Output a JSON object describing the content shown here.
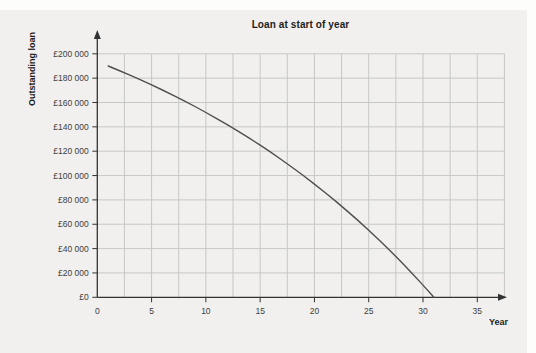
{
  "chart_data": {
    "type": "line",
    "title": "Loan at start of year",
    "xlabel": "Year",
    "ylabel": "Outstanding loan",
    "xlim": [
      0,
      37.5
    ],
    "ylim": [
      0,
      200000
    ],
    "grid": true,
    "x_gridline_step": 2.5,
    "y_gridline_step": 20000,
    "x_ticks": [
      {
        "value": 0,
        "label": "0"
      },
      {
        "value": 5,
        "label": "5"
      },
      {
        "value": 10,
        "label": "10"
      },
      {
        "value": 15,
        "label": "15"
      },
      {
        "value": 20,
        "label": "20"
      },
      {
        "value": 25,
        "label": "25"
      },
      {
        "value": 30,
        "label": "30"
      },
      {
        "value": 35,
        "label": "35"
      }
    ],
    "y_ticks": [
      {
        "value": 0,
        "label": "£0"
      },
      {
        "value": 20000,
        "label": "£20 000"
      },
      {
        "value": 40000,
        "label": "£40 000"
      },
      {
        "value": 60000,
        "label": "£60 000"
      },
      {
        "value": 80000,
        "label": "£80 000"
      },
      {
        "value": 100000,
        "label": "£100 000"
      },
      {
        "value": 120000,
        "label": "£120 000"
      },
      {
        "value": 140000,
        "label": "£140 000"
      },
      {
        "value": 160000,
        "label": "£160 000"
      },
      {
        "value": 180000,
        "label": "£180 000"
      },
      {
        "value": 200000,
        "label": "£200 000"
      }
    ],
    "series": [
      {
        "name": "Outstanding loan",
        "points": [
          [
            1,
            190000
          ],
          [
            2,
            186300
          ],
          [
            3,
            182500
          ],
          [
            4,
            178600
          ],
          [
            5,
            174500
          ],
          [
            6,
            170300
          ],
          [
            7,
            165900
          ],
          [
            8,
            161400
          ],
          [
            9,
            156700
          ],
          [
            10,
            151800
          ],
          [
            11,
            146800
          ],
          [
            12,
            141600
          ],
          [
            13,
            136300
          ],
          [
            14,
            130700
          ],
          [
            15,
            124900
          ],
          [
            16,
            119000
          ],
          [
            17,
            112800
          ],
          [
            18,
            106400
          ],
          [
            19,
            99800
          ],
          [
            20,
            93000
          ],
          [
            21,
            85900
          ],
          [
            22,
            78600
          ],
          [
            23,
            71000
          ],
          [
            24,
            63200
          ],
          [
            25,
            55100
          ],
          [
            26,
            46700
          ],
          [
            27,
            38000
          ],
          [
            28,
            29000
          ],
          [
            29,
            19600
          ],
          [
            30,
            10000
          ],
          [
            31,
            0
          ]
        ]
      }
    ],
    "colors": {
      "panel_background": "#f1f0ee",
      "gridline": "#c7c7c6",
      "axis": "#333333",
      "curve": "#4f4f4f",
      "tick_label": "#3d3d3d",
      "title_text": "#1c1c1c"
    }
  }
}
